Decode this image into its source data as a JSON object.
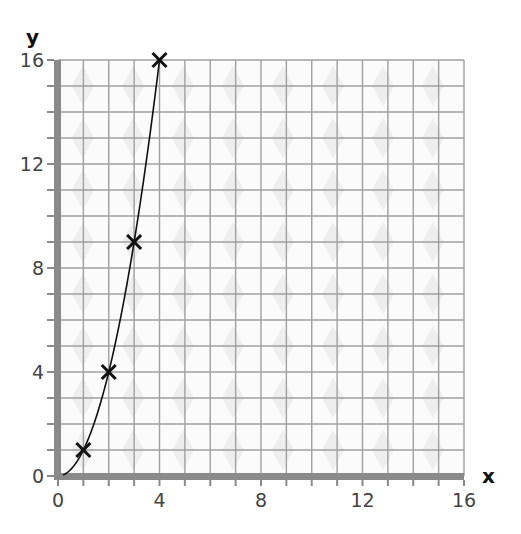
{
  "chart_data": {
    "type": "line",
    "title": "",
    "xlabel": "x",
    "ylabel": "y",
    "xlim": [
      0,
      16
    ],
    "ylim": [
      0,
      16
    ],
    "grid": true,
    "grid_minor_step": 1,
    "x_ticks": [
      0,
      4,
      8,
      12,
      16
    ],
    "y_ticks": [
      0,
      4,
      8,
      12,
      16
    ],
    "x_tick_labels": [
      "0",
      "4",
      "8",
      "12",
      "16"
    ],
    "y_tick_labels": [
      "0",
      "4",
      "8",
      "12",
      "16"
    ],
    "series": [
      {
        "name": "y = x²",
        "marker": "x",
        "points": [
          {
            "x": 1,
            "y": 1
          },
          {
            "x": 2,
            "y": 4
          },
          {
            "x": 3,
            "y": 9
          },
          {
            "x": 4,
            "y": 16
          }
        ],
        "curve": "smooth through origin"
      }
    ],
    "colors": {
      "axis": "#8a8a8a",
      "grid": "#a0a0a0",
      "line": "#111111",
      "marker": "#111111"
    }
  }
}
